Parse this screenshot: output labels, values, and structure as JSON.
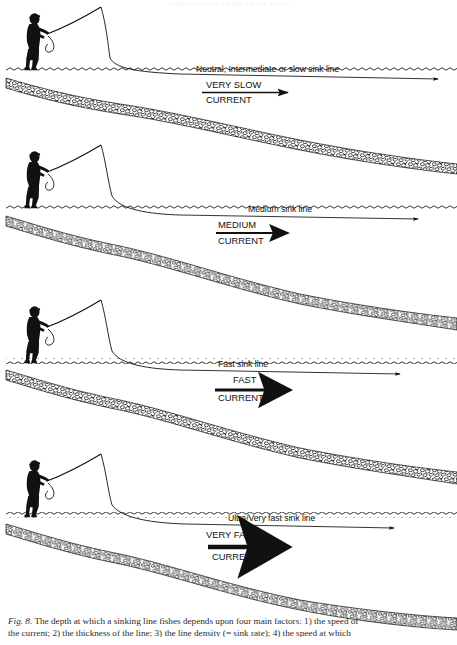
{
  "page": {
    "header_text": "SINKING LINES AND THEIR USES",
    "width": 457,
    "height": 645,
    "background": "#ffffff",
    "ink_color": "#111111"
  },
  "figure": {
    "caption_label": "Fig. 8.",
    "caption_line_1": "The depth at which a sinking line fishes depends upon four main factors: 1) the speed of",
    "caption_line_2": "the current; 2) the thickness of the line; 3) the line density (= sink rate); 4) the speed at which",
    "panels": [
      {
        "id": "panel-very-slow",
        "line_label": "Neutral, Intermediate or slow sink line",
        "speed_label": "VERY SLOW",
        "current_label": "CURRENT",
        "arrow_weight": "thin",
        "sink_depth": "shallow"
      },
      {
        "id": "panel-medium",
        "line_label": "Medium sink line",
        "speed_label": "MEDIUM",
        "current_label": "CURRENT",
        "arrow_weight": "medium",
        "sink_depth": "medium"
      },
      {
        "id": "panel-fast",
        "line_label": "Fast sink line",
        "speed_label": "FAST",
        "current_label": "CURRENT",
        "arrow_weight": "thick",
        "sink_depth": "deep"
      },
      {
        "id": "panel-very-fast",
        "line_label": "Ultra/Very fast sink line",
        "speed_label": "VERY FAST",
        "current_label": "CURRENT",
        "arrow_weight": "very-thick",
        "sink_depth": "deepest"
      }
    ],
    "elements": {
      "angler_icon": "angler-silhouette",
      "rod_icon": "fishing-rod",
      "water_surface_icon": "wavy-water-surface-line",
      "riverbed_icon": "stony-riverbed-band",
      "fly_line_icon": "fly-line",
      "current_arrow_icon": "current-arrow"
    }
  }
}
